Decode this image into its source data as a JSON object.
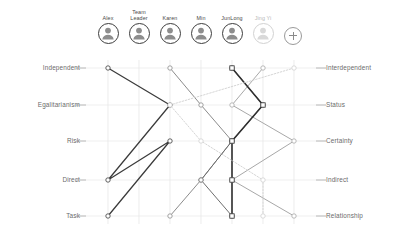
{
  "header": {
    "add_button_label": "+",
    "add_button_icon": "plus-icon"
  },
  "people": [
    {
      "name": "Alex",
      "selected": true,
      "color": "#3b3b3b",
      "x": 108
    },
    {
      "name": "Team\nLeader",
      "selected": true,
      "color": "#8c8c8c",
      "x": 139
    },
    {
      "name": "Karen",
      "selected": true,
      "color": "#6e6e6e",
      "x": 170
    },
    {
      "name": "Min",
      "selected": true,
      "color": "#a8a8a8",
      "x": 201
    },
    {
      "name": "JunLong",
      "selected": true,
      "color": "#2f2f2f",
      "x": 232
    },
    {
      "name": "Jing Yi",
      "selected": false,
      "color": "#d0d0d0",
      "x": 263
    }
  ],
  "chart_data": {
    "type": "line",
    "title": "",
    "subtitle": "",
    "xlabel": "",
    "ylabel": "",
    "grid": true,
    "legend_position": "top",
    "orientation": "parallel-coordinates-horizontal",
    "axis_rows": [
      {
        "left": "Independent",
        "right": "Interdependent",
        "y": 68
      },
      {
        "left": "Egalitarianism",
        "right": "Status",
        "y": 105
      },
      {
        "left": "Risk",
        "right": "Certainty",
        "y": 141
      },
      {
        "left": "Direct",
        "right": "Indirect",
        "y": 180
      },
      {
        "left": "Task",
        "right": "Relationship",
        "y": 216
      }
    ],
    "columns": [
      108,
      139,
      170,
      201,
      232,
      263
    ],
    "x_range": [
      108,
      300
    ],
    "categories": [
      "Independent-Interdependent",
      "Egalitarianism-Status",
      "Risk-Certainty",
      "Direct-Indirect",
      "Task-Relationship"
    ],
    "series": [
      {
        "name": "Alex",
        "color": "#3b3b3b",
        "width": 1.25,
        "marker": "circle",
        "dashed": false,
        "values": [
          108,
          170,
          108,
          170,
          108
        ],
        "points": [
          [
            108,
            68
          ],
          [
            170,
            105
          ],
          [
            108,
            180
          ],
          [
            170,
            141
          ],
          [
            108,
            216
          ]
        ]
      },
      {
        "name": "Team Leader",
        "color": "#8c8c8c",
        "width": 1.0,
        "marker": "circle",
        "dashed": false,
        "values": [
          170,
          201,
          232,
          201,
          170
        ],
        "points": [
          [
            170,
            68
          ],
          [
            201,
            105
          ],
          [
            232,
            141
          ],
          [
            201,
            180
          ],
          [
            170,
            216
          ]
        ]
      },
      {
        "name": "Karen",
        "color": "#6e6e6e",
        "width": 1.0,
        "marker": "circle",
        "dashed": false,
        "values": [
          232,
          263,
          232,
          201,
          232
        ],
        "points": [
          [
            232,
            68
          ],
          [
            263,
            105
          ],
          [
            232,
            141
          ],
          [
            201,
            180
          ],
          [
            232,
            216
          ]
        ]
      },
      {
        "name": "Min",
        "color": "#a8a8a8",
        "width": 1.0,
        "marker": "circle",
        "dashed": false,
        "values": [
          263,
          232,
          294,
          232,
          294
        ],
        "points": [
          [
            263,
            68
          ],
          [
            232,
            105
          ],
          [
            294,
            141
          ],
          [
            232,
            180
          ],
          [
            294,
            216
          ]
        ]
      },
      {
        "name": "JunLong",
        "color": "#2f2f2f",
        "width": 1.6,
        "marker": "square",
        "dashed": false,
        "values": [
          232,
          263,
          232,
          232,
          232
        ],
        "points": [
          [
            232,
            68
          ],
          [
            263,
            105
          ],
          [
            232,
            141
          ],
          [
            232,
            180
          ],
          [
            232,
            216
          ]
        ]
      },
      {
        "name": "Jing Yi",
        "color": "#d0d0d0",
        "width": 0.9,
        "marker": "circle",
        "dashed": true,
        "values": [
          294,
          170,
          201,
          263,
          263
        ],
        "points": [
          [
            294,
            68
          ],
          [
            170,
            105
          ],
          [
            201,
            141
          ],
          [
            263,
            180
          ],
          [
            263,
            216
          ]
        ]
      }
    ]
  }
}
